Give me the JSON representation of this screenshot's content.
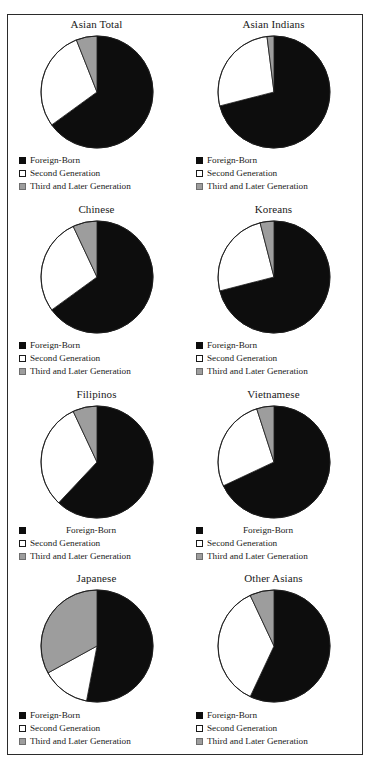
{
  "figure": {
    "legend_labels": {
      "foreign_born": "Foreign-Born",
      "second_generation": "Second Generation",
      "third_and_later": "Third and Later Generation"
    },
    "colors": {
      "foreign_born": "#0d0d0d",
      "second_generation": "#ffffff",
      "third_and_later": "#9d9d9d",
      "frame": "#2b2b2b",
      "background": "#ffffff"
    }
  },
  "chart_data": [
    {
      "type": "pie",
      "title": "Asian Total",
      "categories": [
        "Foreign-Born",
        "Second Generation",
        "Third and Later Generation"
      ],
      "values": [
        65,
        29,
        6
      ],
      "colors": [
        "#0d0d0d",
        "#ffffff",
        "#9d9d9d"
      ],
      "start_angle": 0,
      "direction": "clockwise",
      "legend_position": "below"
    },
    {
      "type": "pie",
      "title": "Asian Indians",
      "categories": [
        "Foreign-Born",
        "Second Generation",
        "Third and Later Generation"
      ],
      "values": [
        71,
        27,
        2
      ],
      "colors": [
        "#0d0d0d",
        "#ffffff",
        "#9d9d9d"
      ],
      "start_angle": 0,
      "direction": "clockwise",
      "legend_position": "below"
    },
    {
      "type": "pie",
      "title": "Chinese",
      "categories": [
        "Foreign-Born",
        "Second Generation",
        "Third and Later Generation"
      ],
      "values": [
        65,
        28,
        7
      ],
      "colors": [
        "#0d0d0d",
        "#ffffff",
        "#9d9d9d"
      ],
      "start_angle": 0,
      "direction": "clockwise",
      "legend_position": "below"
    },
    {
      "type": "pie",
      "title": "Koreans",
      "categories": [
        "Foreign-Born",
        "Second Generation",
        "Third and Later Generation"
      ],
      "values": [
        71,
        25,
        4
      ],
      "colors": [
        "#0d0d0d",
        "#ffffff",
        "#9d9d9d"
      ],
      "start_angle": 0,
      "direction": "clockwise",
      "legend_position": "below"
    },
    {
      "type": "pie",
      "title": "Filipinos",
      "categories": [
        "Foreign-Born",
        "Second Generation",
        "Third and Later Generation"
      ],
      "values": [
        62,
        31,
        7
      ],
      "colors": [
        "#0d0d0d",
        "#ffffff",
        "#9d9d9d"
      ],
      "start_angle": 0,
      "direction": "clockwise",
      "legend_position": "below"
    },
    {
      "type": "pie",
      "title": "Vietnamese",
      "categories": [
        "Foreign-Born",
        "Second Generation",
        "Third and Later Generation"
      ],
      "values": [
        68,
        27,
        5
      ],
      "colors": [
        "#0d0d0d",
        "#ffffff",
        "#9d9d9d"
      ],
      "start_angle": 0,
      "direction": "clockwise",
      "legend_position": "below"
    },
    {
      "type": "pie",
      "title": "Japanese",
      "categories": [
        "Foreign-Born",
        "Second Generation",
        "Third and Later Generation"
      ],
      "values": [
        53,
        14,
        33
      ],
      "colors": [
        "#0d0d0d",
        "#ffffff",
        "#9d9d9d"
      ],
      "start_angle": 0,
      "direction": "clockwise",
      "legend_position": "below"
    },
    {
      "type": "pie",
      "title": "Other Asians",
      "categories": [
        "Foreign-Born",
        "Second Generation",
        "Third and Later Generation"
      ],
      "values": [
        57,
        36,
        7
      ],
      "colors": [
        "#0d0d0d",
        "#ffffff",
        "#9d9d9d"
      ],
      "start_angle": 0,
      "direction": "clockwise",
      "legend_position": "below"
    }
  ]
}
